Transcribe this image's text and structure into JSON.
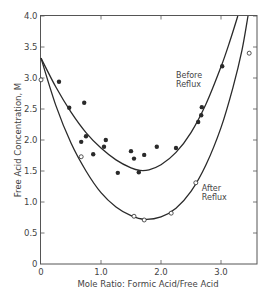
{
  "chart_data": {
    "type": "scatter",
    "title": "",
    "xlabel": "Mole Ratio: Formic Acid/Free Acid",
    "ylabel": "Free Acid Concentration, M",
    "xlim": [
      0,
      3.6
    ],
    "ylim": [
      0,
      4.0
    ],
    "x_ticks": [
      0,
      1.0,
      2.0,
      3.0
    ],
    "x_tick_labels": [
      "0",
      "1.0",
      "2.0",
      "3.0"
    ],
    "y_ticks": [
      0,
      0.5,
      1.0,
      1.5,
      2.0,
      2.5,
      3.0,
      3.5,
      4.0
    ],
    "y_tick_labels": [
      "0",
      "0.5",
      "1.0",
      "1.5",
      "2.0",
      "2.5",
      "3.0",
      "3.5",
      "4.0"
    ],
    "grid": false,
    "legend": "none (curves labeled inline)",
    "series": [
      {
        "name": "Before Reflux",
        "marker": "filled-circle",
        "points": [
          [
            0.3,
            2.94
          ],
          [
            0.47,
            2.52
          ],
          [
            0.72,
            2.6
          ],
          [
            0.75,
            2.06
          ],
          [
            0.67,
            1.97
          ],
          [
            1.08,
            2.0
          ],
          [
            1.05,
            1.89
          ],
          [
            0.87,
            1.77
          ],
          [
            1.28,
            1.47
          ],
          [
            1.5,
            1.82
          ],
          [
            1.55,
            1.7
          ],
          [
            1.63,
            1.48
          ],
          [
            1.72,
            1.76
          ],
          [
            1.93,
            1.89
          ],
          [
            2.25,
            1.87
          ],
          [
            2.62,
            2.29
          ],
          [
            2.67,
            2.4
          ],
          [
            2.68,
            2.53
          ],
          [
            3.02,
            3.19
          ]
        ],
        "curve": [
          [
            0,
            3.32
          ],
          [
            0.25,
            2.85
          ],
          [
            0.5,
            2.45
          ],
          [
            0.75,
            2.12
          ],
          [
            1.0,
            1.87
          ],
          [
            1.25,
            1.68
          ],
          [
            1.5,
            1.55
          ],
          [
            1.65,
            1.51
          ],
          [
            1.8,
            1.52
          ],
          [
            2.0,
            1.6
          ],
          [
            2.25,
            1.8
          ],
          [
            2.5,
            2.12
          ],
          [
            2.75,
            2.58
          ],
          [
            3.0,
            3.18
          ],
          [
            3.15,
            3.6
          ],
          [
            3.28,
            4.0
          ]
        ],
        "label_position": [
          2.25,
          3.0
        ]
      },
      {
        "name": "After Reflux",
        "marker": "open-circle",
        "points": [
          [
            0.0,
            2.97
          ],
          [
            0.67,
            1.73
          ],
          [
            1.55,
            0.77
          ],
          [
            1.72,
            0.71
          ],
          [
            2.17,
            0.82
          ],
          [
            2.58,
            1.31
          ],
          [
            3.47,
            3.4
          ]
        ],
        "curve": [
          [
            0,
            3.32
          ],
          [
            0.25,
            2.55
          ],
          [
            0.5,
            1.95
          ],
          [
            0.75,
            1.5
          ],
          [
            1.0,
            1.15
          ],
          [
            1.25,
            0.92
          ],
          [
            1.5,
            0.78
          ],
          [
            1.73,
            0.72
          ],
          [
            2.0,
            0.76
          ],
          [
            2.25,
            0.9
          ],
          [
            2.5,
            1.17
          ],
          [
            2.75,
            1.6
          ],
          [
            3.0,
            2.2
          ],
          [
            3.2,
            2.85
          ],
          [
            3.35,
            3.45
          ],
          [
            3.45,
            4.0
          ]
        ],
        "label_position": [
          2.68,
          1.18
        ]
      }
    ]
  },
  "labels": {
    "before_reflux": [
      "Before",
      "Reflux"
    ],
    "after_reflux": [
      "After",
      "Reflux"
    ]
  }
}
